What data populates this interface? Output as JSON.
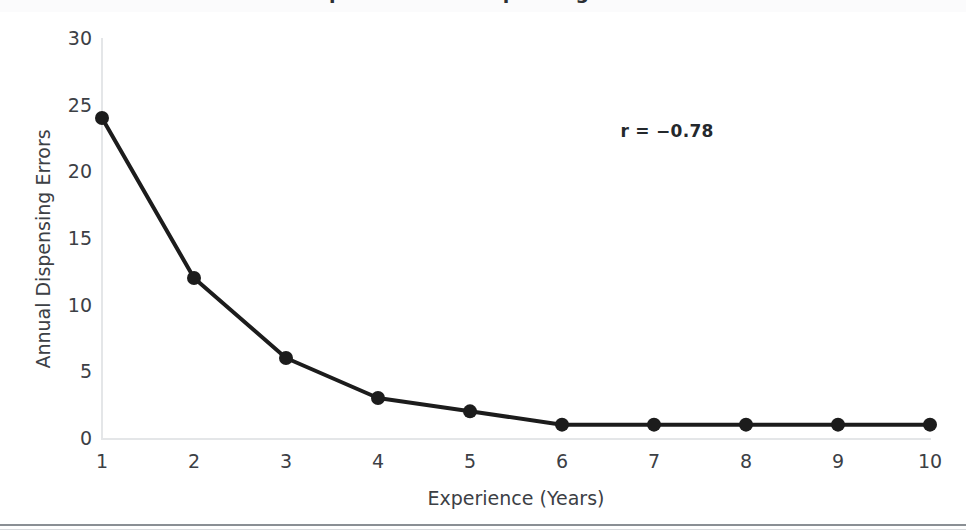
{
  "page": {
    "background_color": "#ffffff",
    "cutoff_title": "Experience vs. Dispensing Errors"
  },
  "chart_data": {
    "type": "line",
    "title": "",
    "xlabel": "Experience (Years)",
    "ylabel": "Annual Dispensing Errors",
    "x": [
      1,
      2,
      3,
      4,
      5,
      6,
      7,
      8,
      9,
      10
    ],
    "values": [
      24,
      12,
      6,
      3,
      2,
      1,
      1,
      1,
      1,
      1
    ],
    "series": [
      {
        "name": "Annual Dispensing Errors",
        "values": [
          24,
          12,
          6,
          3,
          2,
          1,
          1,
          1,
          1,
          1
        ],
        "color": "#1c1c1c",
        "marker": "circle"
      }
    ],
    "xlim": [
      1,
      10
    ],
    "ylim": [
      0,
      30
    ],
    "x_ticks": [
      "1",
      "2",
      "3",
      "4",
      "5",
      "6",
      "7",
      "8",
      "9",
      "10"
    ],
    "y_ticks": [
      "0",
      "5",
      "10",
      "15",
      "20",
      "25",
      "30"
    ],
    "grid": false,
    "legend": false,
    "legend_position": "none",
    "annotations": [
      {
        "name": "correlation-coefficient",
        "text": "r = −0.78",
        "x": 7.2,
        "y": 23,
        "bold": true,
        "color": "#24282c"
      }
    ],
    "axis_color": "#e4e6e8",
    "tick_label_color": "#3c4045",
    "line_width_px": 4,
    "marker_radius_px": 7
  }
}
